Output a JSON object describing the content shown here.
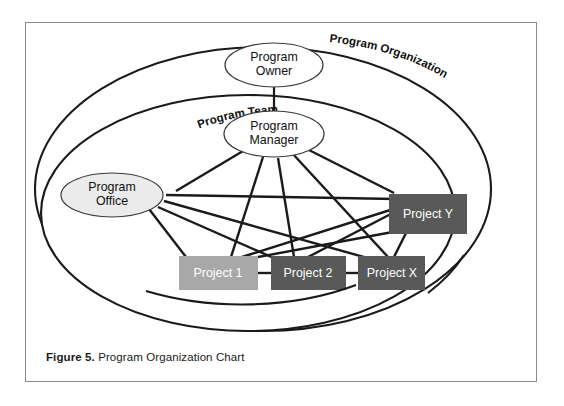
{
  "figure": {
    "caption_label": "Figure 5.",
    "caption_text": "Program Organization Chart"
  },
  "diagram": {
    "type": "organization-chart",
    "rings": [
      {
        "id": "program-organization",
        "label": "Program Organization"
      },
      {
        "id": "program-team",
        "label": "Program Team"
      }
    ],
    "nodes": [
      {
        "id": "program-owner",
        "label_line1": "Program",
        "label_line2": "Owner",
        "shape": "ellipse",
        "fill": "#ffffff"
      },
      {
        "id": "program-manager",
        "label_line1": "Program",
        "label_line2": "Manager",
        "shape": "ellipse",
        "fill": "#ffffff"
      },
      {
        "id": "program-office",
        "label_line1": "Program",
        "label_line2": "Office",
        "shape": "ellipse",
        "fill": "#ebebeb"
      },
      {
        "id": "project-1",
        "label": "Project 1",
        "shape": "rect",
        "fill": "#a8a8a8"
      },
      {
        "id": "project-2",
        "label": "Project 2",
        "shape": "rect",
        "fill": "#595959"
      },
      {
        "id": "project-x",
        "label": "Project X",
        "shape": "rect",
        "fill": "#595959"
      },
      {
        "id": "project-y",
        "label": "Project Y",
        "shape": "rect",
        "fill": "#595959"
      }
    ],
    "edges": [
      {
        "from": "program-owner",
        "to": "program-manager"
      },
      {
        "from": "program-manager",
        "to": "program-office"
      },
      {
        "from": "program-manager",
        "to": "project-1"
      },
      {
        "from": "program-manager",
        "to": "project-2"
      },
      {
        "from": "program-manager",
        "to": "project-x"
      },
      {
        "from": "program-manager",
        "to": "project-y"
      },
      {
        "from": "program-office",
        "to": "project-1"
      },
      {
        "from": "program-office",
        "to": "project-2"
      },
      {
        "from": "program-office",
        "to": "project-x"
      },
      {
        "from": "program-office",
        "to": "project-y"
      },
      {
        "from": "project-1",
        "to": "project-2"
      },
      {
        "from": "project-2",
        "to": "project-x"
      },
      {
        "from": "project-1",
        "to": "project-y"
      },
      {
        "from": "project-2",
        "to": "project-y"
      },
      {
        "from": "project-x",
        "to": "project-y"
      }
    ],
    "colors": {
      "line": "#1a1a1a",
      "frame": "#8a8a8a",
      "box_light": "#a8a8a8",
      "box_dark": "#595959",
      "ellipse_shaded": "#ebebeb",
      "background": "#ffffff"
    }
  }
}
